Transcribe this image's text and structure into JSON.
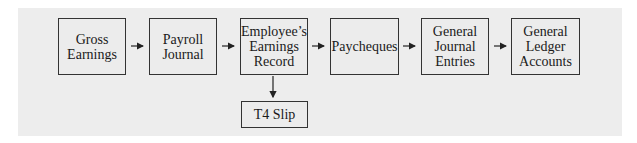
{
  "diagram": {
    "colors": {
      "background": "#ededed",
      "border": "#333333",
      "text": "#1a1a1a"
    },
    "nodes": [
      {
        "id": "gross-earnings",
        "label": "Gross\nEarnings"
      },
      {
        "id": "payroll-journal",
        "label": "Payroll\nJournal"
      },
      {
        "id": "employees-earnings-record",
        "label": "Employee’s\nEarnings\nRecord"
      },
      {
        "id": "paycheques",
        "label": "Paycheques"
      },
      {
        "id": "general-journal-entries",
        "label": "General\nJournal\nEntries"
      },
      {
        "id": "general-ledger-accounts",
        "label": "General\nLedger\nAccounts"
      },
      {
        "id": "t4-slip",
        "label": "T4 Slip"
      }
    ],
    "edges": [
      {
        "from": "gross-earnings",
        "to": "payroll-journal"
      },
      {
        "from": "payroll-journal",
        "to": "employees-earnings-record"
      },
      {
        "from": "employees-earnings-record",
        "to": "paycheques"
      },
      {
        "from": "paycheques",
        "to": "general-journal-entries"
      },
      {
        "from": "general-journal-entries",
        "to": "general-ledger-accounts"
      },
      {
        "from": "employees-earnings-record",
        "to": "t4-slip"
      }
    ]
  }
}
